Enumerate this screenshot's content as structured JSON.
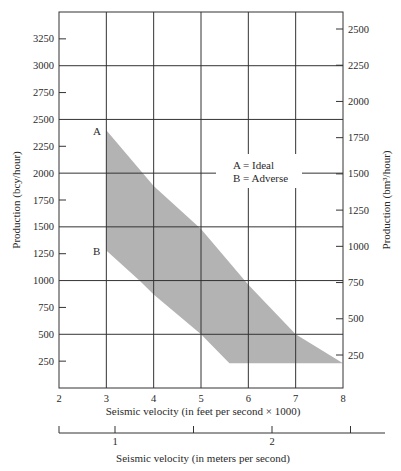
{
  "chart_data": {
    "type": "area",
    "title": "",
    "xlabel": "Seismic velocity (in feet per second × 1000)",
    "xlabel_secondary": "Seismic velocity (in meters per second)",
    "ylabel": "Production (bcy/hour)",
    "ylabel_secondary": "Production (bm³/hour)",
    "xlim": [
      2,
      8
    ],
    "ylim": [
      0,
      3500
    ],
    "grid": true,
    "x_ticks": [
      2,
      3,
      4,
      5,
      6,
      7,
      8
    ],
    "x_tick_labels": [
      "2",
      "3",
      "4",
      "5",
      "6",
      "7",
      "8"
    ],
    "y_ticks": [
      250,
      500,
      750,
      1000,
      1250,
      1500,
      1750,
      2000,
      2250,
      2500,
      2750,
      3000,
      3250
    ],
    "y_tick_labels": [
      "250",
      "500",
      "750",
      "1000",
      "1250",
      "1500",
      "1750",
      "2000",
      "2250",
      "2500",
      "2750",
      "3000",
      "3250"
    ],
    "y_gridlines": [
      500,
      1000,
      1500,
      2000,
      2500,
      3000
    ],
    "x_gridlines": [
      3,
      4,
      5,
      6,
      7
    ],
    "y2_ticks": [
      250,
      500,
      750,
      1000,
      1250,
      1500,
      1750,
      2000,
      2250,
      2500
    ],
    "y2_tick_labels": [
      "250",
      "500",
      "750",
      "1000",
      "1250",
      "1500",
      "1750",
      "2000",
      "2250",
      "2500"
    ],
    "x2_ticks": [
      0.85,
      1.0,
      1.5,
      2.0,
      2.5
    ],
    "x2_tick_labels": [
      "",
      "1",
      "",
      "2",
      ""
    ],
    "series": [
      {
        "name": "A = Ideal (upper bound)",
        "x": [
          3.0,
          4.0,
          5.0,
          6.0,
          7.0,
          8.0
        ],
        "y": [
          2400,
          1880,
          1480,
          960,
          500,
          230
        ]
      },
      {
        "name": "B = Adverse (lower bound)",
        "x": [
          3.0,
          3.7,
          4.0,
          5.0,
          5.6
        ],
        "y": [
          1280,
          1000,
          870,
          500,
          230
        ]
      }
    ],
    "band_bottom": {
      "y": 230,
      "x_from": 5.6,
      "x_to": 8.0
    },
    "annotations": [
      {
        "text": "A",
        "x": 2.8,
        "y": 2400
      },
      {
        "text": "B",
        "x": 2.8,
        "y": 1300
      }
    ],
    "legend": {
      "entries": [
        "A = Ideal",
        "B = Adverse"
      ],
      "position": "upper-right-inside"
    },
    "fill_color": "#b3b3b3",
    "grid_color": "#333333"
  },
  "labels": {
    "point_a": "A",
    "point_b": "B",
    "legend_a": "A = Ideal",
    "legend_b": "B = Adverse",
    "x_title": "Seismic velocity (in feet per second × 1000)",
    "x2_title": "Seismic velocity (in meters per second)",
    "y_title": "Production (bcy/hour)",
    "y2_title": "Production (bm³/hour)"
  }
}
